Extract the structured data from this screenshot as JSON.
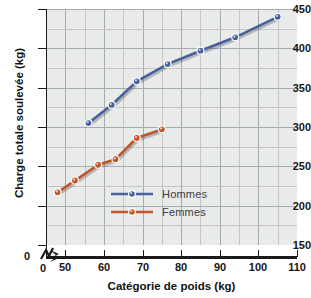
{
  "chart_data": {
    "type": "line",
    "title": "",
    "xlabel": "Catégorie de poids (kg)",
    "ylabel": "Charge totale soulevée (kg)",
    "xlim": [
      45,
      110
    ],
    "ylim": [
      150,
      450
    ],
    "x_ticks": [
      0,
      50,
      60,
      70,
      80,
      90,
      100,
      110
    ],
    "y_ticks": [
      0,
      150,
      200,
      250,
      300,
      350,
      400,
      450
    ],
    "x_axis_break": true,
    "y_axis_break": true,
    "grid": true,
    "legend_position": "center",
    "series": [
      {
        "name": "Hommes",
        "color": "#4a5f9e",
        "points": [
          {
            "x": 56,
            "y": 305
          },
          {
            "x": 62,
            "y": 328
          },
          {
            "x": 68.5,
            "y": 358
          },
          {
            "x": 76.5,
            "y": 380
          },
          {
            "x": 85,
            "y": 397
          },
          {
            "x": 94,
            "y": 414
          },
          {
            "x": 105,
            "y": 440
          }
        ]
      },
      {
        "name": "Femmes",
        "color": "#c0562a",
        "points": [
          {
            "x": 48,
            "y": 217
          },
          {
            "x": 52.5,
            "y": 232
          },
          {
            "x": 58.5,
            "y": 252
          },
          {
            "x": 63,
            "y": 259
          },
          {
            "x": 68.5,
            "y": 286
          },
          {
            "x": 75,
            "y": 297
          }
        ]
      }
    ]
  },
  "axes": {
    "y_tick_labels": [
      "450",
      "400",
      "350",
      "300",
      "250",
      "200",
      "150"
    ],
    "x_tick_labels": [
      "50",
      "60",
      "70",
      "80",
      "90",
      "100",
      "110"
    ],
    "origin_y_label": "0",
    "origin_x_label": "0"
  },
  "legend": {
    "items": [
      {
        "label": "Hommes",
        "color": "#4a5f9e"
      },
      {
        "label": "Femmes",
        "color": "#c0562a"
      }
    ]
  }
}
